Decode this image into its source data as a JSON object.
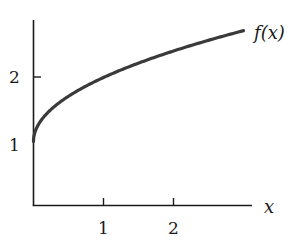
{
  "chart_data": {
    "type": "line",
    "title": "",
    "xlabel": "x",
    "ylabel": "",
    "xlim": [
      0,
      3.1
    ],
    "ylim": [
      0,
      2.85
    ],
    "grid": false,
    "legend": "none",
    "x_ticks": [
      1,
      2
    ],
    "y_ticks": [
      1,
      2
    ],
    "x_tick_labels": [
      "1",
      "2"
    ],
    "y_tick_labels": [
      "1",
      "2"
    ],
    "series": [
      {
        "name": "f(x)",
        "function": "1 + sqrt(x)",
        "x": [
          0,
          0.05,
          0.1,
          0.25,
          0.5,
          0.75,
          1.0,
          1.5,
          2.0,
          2.5,
          3.0
        ],
        "values": [
          1.0,
          1.22,
          1.32,
          1.5,
          1.71,
          1.87,
          2.0,
          2.22,
          2.41,
          2.58,
          2.73
        ],
        "color": "#3a3a3a"
      }
    ],
    "annotations": [
      {
        "text": "f(x)",
        "x": 3.0,
        "y": 2.73,
        "position": "right-of-curve-end"
      }
    ]
  },
  "labels": {
    "curve": "f(x)",
    "x_axis": "x",
    "x_tick_1": "1",
    "x_tick_2": "2",
    "y_tick_1": "1",
    "y_tick_2": "2"
  }
}
